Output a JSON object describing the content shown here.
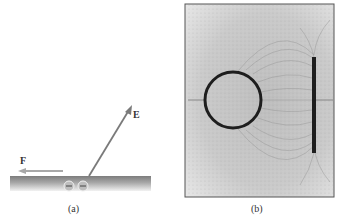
{
  "figure": {
    "panel_a": {
      "caption": "(a)",
      "vectors": [
        {
          "label": "E",
          "description": "electric field vector pointing up-right away from surface"
        },
        {
          "label": "F",
          "description": "force vector pointing left along surface"
        }
      ],
      "charges": [
        "−",
        "−"
      ],
      "colors": {
        "surface": "#9a9a9a",
        "arrow": "#808080"
      }
    },
    "panel_b": {
      "caption": "(b)",
      "description": "Electric field lines between a charged ring and a charged rod (grass-seed photograph)",
      "colors": {
        "background": "#c8c8c8",
        "conductor": "#1e1e1e",
        "border": "#555555"
      }
    }
  }
}
